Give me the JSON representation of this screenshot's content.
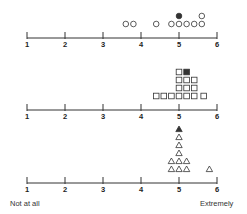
{
  "chart_data": {
    "type": "scatter",
    "subtype": "dot-plot",
    "title": "",
    "xlabel": "",
    "ylabel": "",
    "xlim": [
      1,
      6
    ],
    "ticks": [
      "1",
      "2",
      "3",
      "4",
      "5",
      "6"
    ],
    "end_labels": {
      "low": "Not at all",
      "high": "Extremely"
    },
    "grid": false,
    "legend": null,
    "panels": [
      {
        "name": "circles",
        "marker": "circle",
        "open_points": [
          {
            "x": 3.6,
            "level": 0
          },
          {
            "x": 3.8,
            "level": 0
          },
          {
            "x": 4.4,
            "level": 0
          },
          {
            "x": 4.8,
            "level": 0
          },
          {
            "x": 5.0,
            "level": 0
          },
          {
            "x": 5.2,
            "level": 0
          },
          {
            "x": 5.4,
            "level": 0
          },
          {
            "x": 5.6,
            "level": 0
          },
          {
            "x": 5.6,
            "level": 1
          }
        ],
        "filled_points": [
          {
            "x": 5.0,
            "level": 1
          }
        ]
      },
      {
        "name": "squares",
        "marker": "square",
        "open_points": [
          {
            "x": 4.4,
            "level": 0
          },
          {
            "x": 4.6,
            "level": 0
          },
          {
            "x": 4.8,
            "level": 0
          },
          {
            "x": 5.0,
            "level": 0
          },
          {
            "x": 5.2,
            "level": 0
          },
          {
            "x": 5.4,
            "level": 0
          },
          {
            "x": 5.65,
            "level": 0
          },
          {
            "x": 5.0,
            "level": 1
          },
          {
            "x": 5.2,
            "level": 1
          },
          {
            "x": 5.4,
            "level": 1
          },
          {
            "x": 5.0,
            "level": 2
          },
          {
            "x": 5.2,
            "level": 2
          },
          {
            "x": 5.4,
            "level": 2
          },
          {
            "x": 5.0,
            "level": 3
          }
        ],
        "filled_points": [
          {
            "x": 5.2,
            "level": 3
          }
        ]
      },
      {
        "name": "triangles",
        "marker": "triangle",
        "open_points": [
          {
            "x": 4.8,
            "level": 0
          },
          {
            "x": 5.0,
            "level": 0
          },
          {
            "x": 5.2,
            "level": 0
          },
          {
            "x": 5.8,
            "level": 0
          },
          {
            "x": 4.8,
            "level": 1
          },
          {
            "x": 5.0,
            "level": 1
          },
          {
            "x": 5.2,
            "level": 1
          },
          {
            "x": 5.0,
            "level": 2
          },
          {
            "x": 5.0,
            "level": 3
          },
          {
            "x": 5.0,
            "level": 4
          }
        ],
        "filled_points": [
          {
            "x": 5.0,
            "level": 5
          }
        ]
      }
    ]
  },
  "layout": {
    "x_start": 27,
    "unit_px": 38,
    "axis_y": [
      38,
      110,
      183
    ],
    "level_px": 8,
    "color": "#333333"
  }
}
